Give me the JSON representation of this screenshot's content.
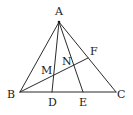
{
  "diagram": {
    "type": "geometry-triangle",
    "colors": {
      "line": "#2a2a2a",
      "label": "#1a1a1a",
      "background": "#ffffff"
    },
    "points": {
      "A": {
        "label": "A",
        "x": 59,
        "y": 22,
        "lx": 55,
        "ly": 15
      },
      "B": {
        "label": "B",
        "x": 20,
        "y": 92,
        "lx": 7,
        "ly": 98
      },
      "C": {
        "label": "C",
        "x": 116,
        "y": 92,
        "lx": 117,
        "ly": 98
      },
      "D": {
        "label": "D",
        "x": 52,
        "y": 92,
        "lx": 48,
        "ly": 106
      },
      "E": {
        "label": "E",
        "x": 83,
        "y": 92,
        "lx": 79,
        "ly": 106
      },
      "F": {
        "label": "F",
        "x": 88,
        "y": 58,
        "lx": 90,
        "ly": 55
      },
      "M": {
        "label": "M",
        "x": 53,
        "y": 75,
        "lx": 41,
        "ly": 74
      },
      "N": {
        "label": "N",
        "x": 72,
        "y": 67,
        "lx": 62,
        "ly": 65
      }
    },
    "segments": [
      [
        "A",
        "B"
      ],
      [
        "A",
        "C"
      ],
      [
        "B",
        "C"
      ],
      [
        "A",
        "D"
      ],
      [
        "A",
        "E"
      ],
      [
        "B",
        "F"
      ]
    ]
  }
}
